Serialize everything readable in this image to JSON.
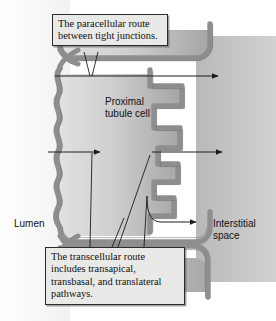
{
  "figure": {
    "background_color": "#ffffff"
  },
  "callouts": {
    "paracellular": {
      "line1": "The paracellular route",
      "line2": "between tight junctions."
    },
    "transcellular": {
      "line1": "The transcellular route",
      "line2": "includes transapical,",
      "line3": "transbasal, and translateral",
      "line4": "pathways."
    }
  },
  "labels": {
    "cell": "Proximal\ntubule cell",
    "lumen": "Lumen",
    "interstitial": "Interstitial\nspace"
  },
  "colors": {
    "membrane": "#8e8e8e",
    "membrane_edge": "#6f6f6f",
    "cytoplasm_light": "#d8d8d8",
    "cytoplasm_dark": "#a9a9a9",
    "interstitium": "#c4c4c4",
    "lumen": "#fbfbfb",
    "ink": "#1c1c1c",
    "callout_fill": "#e9e9e7"
  }
}
